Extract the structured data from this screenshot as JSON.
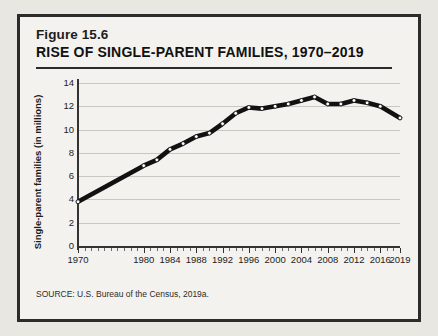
{
  "figure": {
    "number_label": "Figure 15.6",
    "title": "RISE OF SINGLE-PARENT FAMILIES, 1970–2019",
    "source": "SOURCE: U.S. Bureau of the Census, 2019a."
  },
  "colors": {
    "page_background": "#e9e7e2",
    "card_background": "#f4f2ee",
    "frame": "#2b2b2b",
    "line": "#111111",
    "marker_fill": "#ffffff",
    "gridline": "#c9c7c2",
    "axis": "#333333",
    "text": "#1c1c1c"
  },
  "chart_data": {
    "type": "line",
    "title": "RISE OF SINGLE-PARENT FAMILIES, 1970–2019",
    "xlabel": "",
    "ylabel": "Single-parent families (in millions)",
    "xlim": [
      1970,
      2019
    ],
    "ylim": [
      0,
      14
    ],
    "grid": true,
    "legend": false,
    "ytick_labels": [
      "0",
      "2",
      "4",
      "6",
      "8",
      "10",
      "12",
      "14"
    ],
    "ytick_values": [
      0,
      2,
      4,
      6,
      8,
      10,
      12,
      14
    ],
    "xtick_labels": [
      "1970",
      "1980",
      "1984",
      "1988",
      "1992",
      "1996",
      "2000",
      "2004",
      "2008",
      "2012",
      "2016",
      "2019"
    ],
    "xtick_values": [
      1970,
      1980,
      1984,
      1988,
      1992,
      1996,
      2000,
      2004,
      2008,
      2012,
      2016,
      2019
    ],
    "x": [
      1970,
      1980,
      1982,
      1984,
      1986,
      1988,
      1990,
      1992,
      1994,
      1996,
      1998,
      2000,
      2002,
      2004,
      2006,
      2008,
      2010,
      2012,
      2014,
      2016,
      2019
    ],
    "values": [
      3.8,
      6.9,
      7.4,
      8.3,
      8.8,
      9.4,
      9.7,
      10.5,
      11.4,
      11.9,
      11.8,
      12.0,
      12.2,
      12.5,
      12.8,
      12.2,
      12.2,
      12.5,
      12.3,
      12.0,
      11.0
    ],
    "series": [
      {
        "name": "Single-parent families",
        "values": [
          3.8,
          6.9,
          7.4,
          8.3,
          8.8,
          9.4,
          9.7,
          10.5,
          11.4,
          11.9,
          11.8,
          12.0,
          12.2,
          12.5,
          12.8,
          12.2,
          12.2,
          12.5,
          12.3,
          12.0,
          11.0
        ]
      }
    ]
  }
}
